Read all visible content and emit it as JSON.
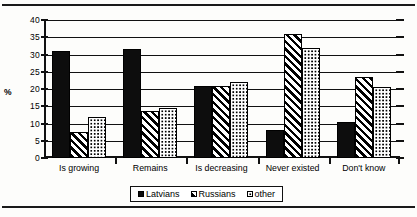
{
  "chart_data": {
    "type": "bar",
    "title": "",
    "subtitle": "",
    "xlabel": "",
    "ylabel": "%",
    "ylim": [
      0,
      40
    ],
    "ytick_step": 5,
    "yticks": [
      "0",
      "5",
      "10",
      "15",
      "20",
      "25",
      "30",
      "35",
      "40"
    ],
    "grid": true,
    "legend_position": "bottom",
    "categories": [
      "Is  growing",
      "Remains",
      "Is decreasing",
      "Never existed",
      "Don't know"
    ],
    "series": [
      {
        "name": "Latvians",
        "pattern": "solid-black",
        "color": "#0d0d0d",
        "values": [
          31,
          31.5,
          21,
          8,
          10.5
        ]
      },
      {
        "name": "Russians",
        "pattern": "diagonal-hatch",
        "color": "#ffffff",
        "values": [
          7.5,
          13.5,
          21,
          36,
          23.5
        ]
      },
      {
        "name": "other",
        "pattern": "dotted",
        "color": "#ffffff",
        "values": [
          12,
          14.5,
          22,
          32,
          20.5
        ]
      }
    ]
  },
  "legend": {
    "items": [
      {
        "label": "Latvians",
        "pattern": "solid-black"
      },
      {
        "label": "Russians",
        "pattern": "diagonal-hatch"
      },
      {
        "label": "other",
        "pattern": "dotted"
      }
    ]
  },
  "axis": {
    "unit_label": "%"
  },
  "colors": {
    "ink": "#111111",
    "paper": "#fdfdfb",
    "bar_fill": "#0d0d0d"
  }
}
